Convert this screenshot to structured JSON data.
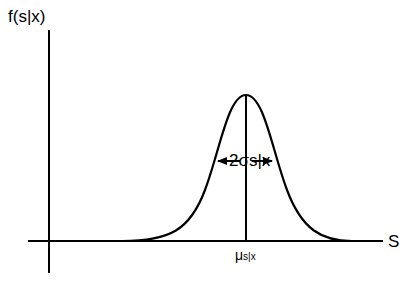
{
  "diagram": {
    "type": "normal-distribution-curve",
    "y_axis_label": "f(s|x)",
    "x_axis_label": "S",
    "width_annotation": {
      "prefix": "2σ",
      "subscript": "s|x"
    },
    "mean_annotation": {
      "symbol": "μ",
      "subscript": "s|x"
    },
    "stroke_color": "#000000",
    "background_color": "#ffffff"
  }
}
